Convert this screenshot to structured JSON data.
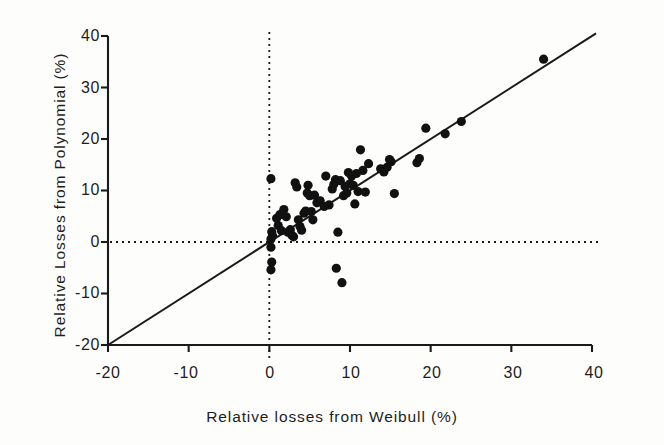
{
  "chart_data": {
    "type": "scatter",
    "title": "",
    "xlabel": "Relative losses from Weibull (%)",
    "ylabel": "Relative Losses from Polynomial (%)",
    "xlim": [
      -20,
      40
    ],
    "ylim": [
      -20,
      40
    ],
    "xticks": [
      -20,
      -10,
      0,
      10,
      20,
      30,
      40
    ],
    "yticks": [
      -20,
      -10,
      0,
      10,
      20,
      30,
      40
    ],
    "xtick_labels": [
      "-20",
      "-10",
      "0",
      "10",
      "20",
      "30",
      "40"
    ],
    "ytick_labels": [
      "-20",
      "-10",
      "0",
      "10",
      "20",
      "30",
      "40"
    ],
    "grid": false,
    "legend": "none",
    "marker": "filled-circle",
    "marker_color": "#111111",
    "reference_line": {
      "name": "identity-line",
      "equation": "y = x",
      "from": [
        -20,
        -20
      ],
      "to": [
        40,
        40
      ],
      "style": "solid"
    },
    "zero_lines": [
      {
        "name": "vertical-zero-line",
        "axis": "x",
        "value": 0,
        "style": "dotted"
      },
      {
        "name": "horizontal-zero-line",
        "axis": "y",
        "value": 0,
        "style": "dotted"
      }
    ],
    "points": [
      [
        0.2,
        12.3
      ],
      [
        0.3,
        2.0
      ],
      [
        0.4,
        1.2
      ],
      [
        0.2,
        0.6
      ],
      [
        0.2,
        -1.0
      ],
      [
        0.3,
        -3.9
      ],
      [
        0.2,
        -5.4
      ],
      [
        0.9,
        4.6
      ],
      [
        1.1,
        3.2
      ],
      [
        1.3,
        5.3
      ],
      [
        1.5,
        2.2
      ],
      [
        1.8,
        6.3
      ],
      [
        2.1,
        4.9
      ],
      [
        2.3,
        1.9
      ],
      [
        2.6,
        2.4
      ],
      [
        2.8,
        1.3
      ],
      [
        3.0,
        1.0
      ],
      [
        3.2,
        11.5
      ],
      [
        3.4,
        10.7
      ],
      [
        3.6,
        4.3
      ],
      [
        3.8,
        3.0
      ],
      [
        4.0,
        2.3
      ],
      [
        4.3,
        5.6
      ],
      [
        4.5,
        6.0
      ],
      [
        4.7,
        9.5
      ],
      [
        4.8,
        11.0
      ],
      [
        5.0,
        9.0
      ],
      [
        5.2,
        5.9
      ],
      [
        5.4,
        4.3
      ],
      [
        5.6,
        9.1
      ],
      [
        5.9,
        7.6
      ],
      [
        6.3,
        8.0
      ],
      [
        6.8,
        6.9
      ],
      [
        7.0,
        12.8
      ],
      [
        7.4,
        7.2
      ],
      [
        7.8,
        10.3
      ],
      [
        8.0,
        11.2
      ],
      [
        8.2,
        12.1
      ],
      [
        8.3,
        -5.1
      ],
      [
        8.5,
        1.9
      ],
      [
        8.8,
        11.9
      ],
      [
        9.0,
        -7.9
      ],
      [
        9.2,
        9.0
      ],
      [
        9.4,
        10.8
      ],
      [
        9.6,
        9.5
      ],
      [
        9.8,
        13.5
      ],
      [
        10.0,
        11.3
      ],
      [
        10.2,
        12.8
      ],
      [
        10.4,
        11.0
      ],
      [
        10.6,
        7.4
      ],
      [
        10.8,
        13.3
      ],
      [
        11.0,
        9.8
      ],
      [
        11.3,
        17.9
      ],
      [
        11.6,
        13.9
      ],
      [
        11.9,
        9.7
      ],
      [
        12.3,
        15.2
      ],
      [
        13.8,
        14.2
      ],
      [
        14.2,
        13.6
      ],
      [
        14.6,
        14.5
      ],
      [
        14.9,
        16.0
      ],
      [
        15.1,
        15.6
      ],
      [
        15.5,
        9.4
      ],
      [
        18.3,
        15.4
      ],
      [
        18.6,
        16.2
      ],
      [
        19.4,
        22.1
      ],
      [
        21.8,
        21.0
      ],
      [
        23.8,
        23.4
      ],
      [
        34.0,
        35.5
      ]
    ]
  }
}
